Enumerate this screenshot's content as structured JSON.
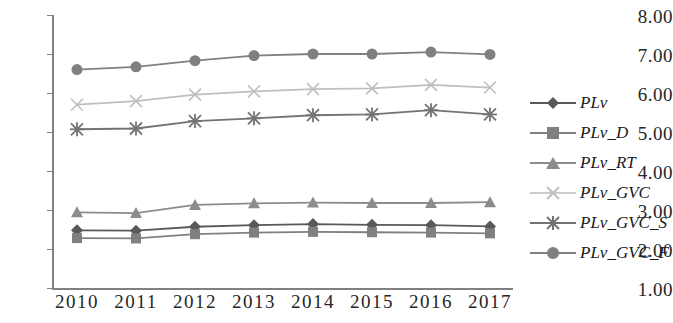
{
  "chart_data": {
    "type": "line",
    "title": "",
    "xlabel": "",
    "ylabel": "",
    "x": [
      "2010",
      "2011",
      "2012",
      "2013",
      "2014",
      "2015",
      "2016",
      "2017"
    ],
    "categories": [
      "2010",
      "2011",
      "2012",
      "2013",
      "2014",
      "2015",
      "2016",
      "2017"
    ],
    "ylim": [
      1.0,
      8.0
    ],
    "yticks": [
      "1.00",
      "2.00",
      "3.00",
      "4.00",
      "5.00",
      "6.00",
      "7.00",
      "8.00"
    ],
    "ytick_values": [
      1.0,
      2.0,
      3.0,
      4.0,
      5.0,
      6.0,
      7.0,
      8.0
    ],
    "grid": false,
    "legend_position": "right",
    "series": [
      {
        "name": "PLv",
        "marker": "diamond",
        "color": "#595959",
        "values": [
          2.48,
          2.47,
          2.57,
          2.61,
          2.64,
          2.62,
          2.61,
          2.58
        ]
      },
      {
        "name": "PLv_D",
        "marker": "square",
        "color": "#808080",
        "values": [
          2.28,
          2.27,
          2.38,
          2.42,
          2.44,
          2.43,
          2.42,
          2.4
        ]
      },
      {
        "name": "PLv_RT",
        "marker": "triangle",
        "color": "#8c8c8c",
        "values": [
          2.94,
          2.92,
          3.13,
          3.17,
          3.19,
          3.18,
          3.18,
          3.2
        ]
      },
      {
        "name": "PLv_GVC",
        "marker": "x",
        "color": "#bfbfbf",
        "values": [
          5.7,
          5.79,
          5.96,
          6.04,
          6.1,
          6.12,
          6.21,
          6.14
        ]
      },
      {
        "name": "PLv_GVC_S",
        "marker": "asterisk",
        "color": "#737373",
        "values": [
          5.07,
          5.09,
          5.28,
          5.35,
          5.43,
          5.45,
          5.56,
          5.45
        ]
      },
      {
        "name": "PLv_GVC_F",
        "marker": "circle",
        "color": "#808080",
        "values": [
          6.6,
          6.67,
          6.83,
          6.96,
          7.0,
          7.0,
          7.05,
          6.99
        ]
      }
    ]
  },
  "axes": {
    "axis_color": "#808080",
    "tick_color": "#808080",
    "label_color": "#262626"
  }
}
